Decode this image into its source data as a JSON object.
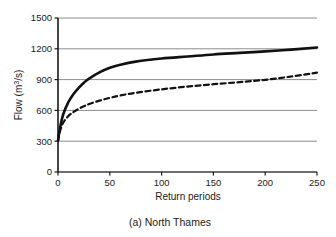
{
  "chart_data": {
    "type": "line",
    "title": "",
    "caption": "(a) North Thames",
    "xlabel": "Return periods",
    "ylabel": "Flow (m3/s)",
    "ylabel_base": "Flow (m",
    "ylabel_sup": "3",
    "ylabel_tail": "/s)",
    "xlim": [
      0,
      250
    ],
    "ylim": [
      0,
      1500
    ],
    "xticks": [
      0,
      50,
      100,
      150,
      200,
      250
    ],
    "xtick_labels": [
      "0",
      "50",
      "100",
      "150",
      "200",
      "250"
    ],
    "yticks": [
      0,
      300,
      600,
      900,
      1200,
      1500
    ],
    "ytick_labels": [
      "0",
      "300",
      "600",
      "900",
      "1200",
      "1500"
    ],
    "grid": "horizontal",
    "legend": "none",
    "x": [
      0,
      2,
      5,
      10,
      15,
      20,
      25,
      30,
      40,
      50,
      60,
      75,
      100,
      125,
      150,
      175,
      200,
      225,
      250
    ],
    "series": [
      {
        "name": "solid-curve",
        "style": "solid",
        "color": "#111111",
        "width": 2.6,
        "values": [
          305,
          430,
          560,
          680,
          760,
          820,
          870,
          910,
          970,
          1015,
          1045,
          1075,
          1105,
          1125,
          1145,
          1160,
          1175,
          1192,
          1212
        ]
      },
      {
        "name": "dashed-curve",
        "style": "dashed",
        "color": "#111111",
        "width": 2.2,
        "values": [
          305,
          400,
          480,
          545,
          585,
          615,
          640,
          662,
          695,
          722,
          745,
          772,
          805,
          832,
          855,
          875,
          898,
          930,
          968
        ]
      }
    ]
  },
  "geometry": {
    "plot_left": 58,
    "plot_right": 317,
    "plot_top": 18,
    "plot_bottom": 172
  },
  "colors": {
    "grid": "#8c8c8c",
    "axis": "#1a1a1a",
    "text": "#1a1a1a",
    "background": "#ffffff"
  }
}
